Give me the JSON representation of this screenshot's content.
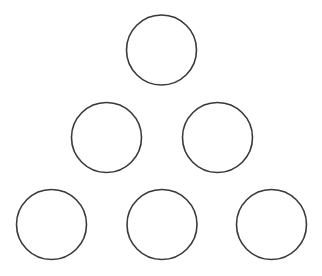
{
  "diagram": {
    "type": "triangle-arrangement-of-circles",
    "canvas": {
      "width": 322,
      "height": 276,
      "background": "#ffffff"
    },
    "stroke_color": "#3a3a3a",
    "fill_color": "#ffffff",
    "rows": [
      {
        "row": 1,
        "count": 1
      },
      {
        "row": 2,
        "count": 2
      },
      {
        "row": 3,
        "count": 3
      }
    ],
    "circles": [
      {
        "id": "row1-center",
        "cx": 161.5,
        "cy": 50,
        "r": 35
      },
      {
        "id": "row2-left",
        "cx": 106.5,
        "cy": 137.5,
        "r": 35
      },
      {
        "id": "row2-right",
        "cx": 217.5,
        "cy": 137.5,
        "r": 35
      },
      {
        "id": "row3-left",
        "cx": 51.5,
        "cy": 224.5,
        "r": 35
      },
      {
        "id": "row3-center",
        "cx": 162,
        "cy": 224.5,
        "r": 35
      },
      {
        "id": "row3-right",
        "cx": 271.5,
        "cy": 224.5,
        "r": 35
      }
    ]
  }
}
